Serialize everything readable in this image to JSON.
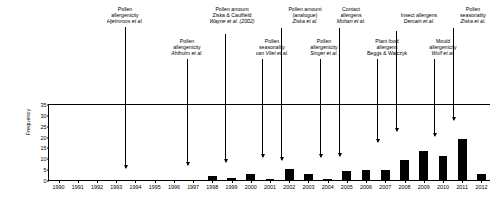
{
  "chart_data": {
    "type": "bar",
    "title": "",
    "xlabel": "",
    "ylabel": "Frequency",
    "ylim": [
      0,
      35
    ],
    "yticks": [
      0,
      5,
      10,
      15,
      20,
      25,
      30,
      35
    ],
    "grid": false,
    "legend": "none",
    "bar_color": "#000000",
    "categories": [
      "1990",
      "1991",
      "1992",
      "1993",
      "1994",
      "1995",
      "1996",
      "1997",
      "1998",
      "1999",
      "2000",
      "2001",
      "2002",
      "2003",
      "2004",
      "2005",
      "2006",
      "2007",
      "2008",
      "2009",
      "2010",
      "2011",
      "2012"
    ],
    "values": [
      0,
      0,
      0,
      0,
      0,
      0,
      0,
      0,
      2,
      1,
      3,
      0.6,
      5,
      3,
      0.6,
      4,
      4.5,
      4.5,
      9,
      13.5,
      11,
      19,
      3
    ],
    "annotations": [
      {
        "id": "hjelmroos",
        "lines": [
          "Pollen",
          "allergenicity",
          "Hjelmroos et al."
        ],
        "italic_line": 2,
        "target_year": 1995
      },
      {
        "id": "ahlholm",
        "lines": [
          "Pollen",
          "allergenicity",
          "Ahlholm et al."
        ],
        "italic_line": 2,
        "target_year": 1998
      },
      {
        "id": "ziska-caulfield-wayne",
        "lines": [
          "Pollen amount",
          "Ziska & Caulfield",
          "Wayne et al. (2002)"
        ],
        "italic_line": 2,
        "target_year": 2000
      },
      {
        "id": "van-vliet",
        "lines": [
          "Pollen",
          "seasonality",
          "van Vliet et al."
        ],
        "italic_line": 2,
        "target_year": 2002
      },
      {
        "id": "ziska-analogue",
        "lines": [
          "Pollen amount",
          "(analogue)",
          "Ziska et al."
        ],
        "italic_line": 2,
        "target_year": 2003
      },
      {
        "id": "singer",
        "lines": [
          "Pollen",
          "allergenicity",
          "Singer et al."
        ],
        "italic_line": 2,
        "target_year": 2005
      },
      {
        "id": "mohan",
        "lines": [
          "Contact",
          "allergens",
          "Mohan et al."
        ],
        "italic_line": 2,
        "target_year": 2006
      },
      {
        "id": "beggs-walczyk",
        "lines": [
          "Plant food",
          "allergens",
          "Beggs & Walczyk"
        ],
        "italic_line": -1,
        "target_year": 2008
      },
      {
        "id": "demain",
        "lines": [
          "Insect allergens",
          "Demain et al."
        ],
        "italic_line": 1,
        "target_year": 2009
      },
      {
        "id": "wolf",
        "lines": [
          "Mould",
          "allergenicity",
          "Wolf et al."
        ],
        "italic_line": 2,
        "target_year": 2010
      },
      {
        "id": "ziska-seasonality",
        "lines": [
          "Pollen",
          "seasonality",
          "Ziska et al."
        ],
        "italic_line": 2,
        "target_year": 2011
      }
    ]
  }
}
